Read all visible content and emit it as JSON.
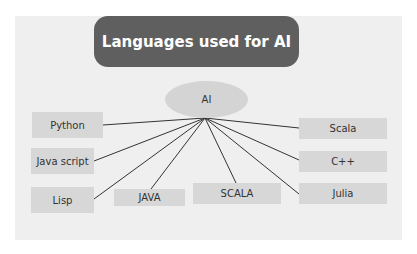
{
  "diagram": {
    "title": "Languages used for AI",
    "hub": {
      "label": "AI"
    },
    "nodes": [
      {
        "id": "python",
        "label": "Python"
      },
      {
        "id": "javascript",
        "label": "Java script"
      },
      {
        "id": "lisp",
        "label": "Lisp"
      },
      {
        "id": "java",
        "label": "JAVA"
      },
      {
        "id": "scala-upper",
        "label": "SCALA"
      },
      {
        "id": "julia",
        "label": "Julia"
      },
      {
        "id": "cpp",
        "label": "C++"
      },
      {
        "id": "scala",
        "label": "Scala"
      }
    ],
    "colors": {
      "panel": "#efefef",
      "title_bg": "#5f5f5f",
      "title_text": "#ffffff",
      "hub": "#d4d4d4",
      "node": "#d7d7d7",
      "line": "#333333"
    }
  }
}
